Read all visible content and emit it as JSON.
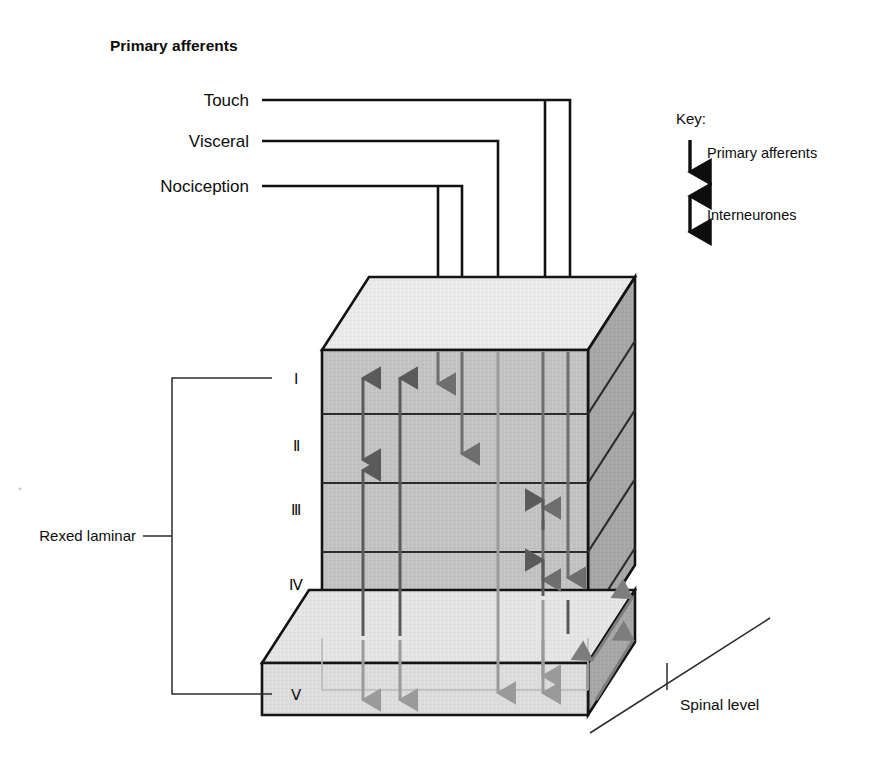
{
  "figure": {
    "title": "Primary afferents"
  },
  "afferents": [
    {
      "id": "touch",
      "label": "Touch"
    },
    {
      "id": "visceral",
      "label": "Visceral"
    },
    {
      "id": "nociception",
      "label": "Nociception"
    }
  ],
  "key": {
    "heading": "Key:",
    "items": [
      {
        "id": "primary-afferents",
        "label": "Primary afferents",
        "arrow": "down-arrow-icon"
      },
      {
        "id": "interneurones",
        "label": "Interneurones",
        "arrow": "double-headed-arrow-icon"
      }
    ]
  },
  "laminae": {
    "bracket_label": "Rexed laminar",
    "levels": [
      {
        "id": "lamina-1",
        "numeral": "Ⅰ"
      },
      {
        "id": "lamina-2",
        "numeral": "Ⅱ"
      },
      {
        "id": "lamina-3",
        "numeral": "Ⅲ"
      },
      {
        "id": "lamina-4",
        "numeral": "Ⅳ"
      },
      {
        "id": "lamina-5",
        "numeral": "Ⅴ"
      }
    ]
  },
  "depth_axis": {
    "label": "Spinal level"
  },
  "colors": {
    "top_face": "#e9e9e9",
    "front_face": "#c2c2c2",
    "right_face": "#a6a6a6",
    "slab_front": "#dcdcdc",
    "slab_top": "#e4e4e4",
    "outline": "#141414",
    "afferent_arrow": "#6e6e6e",
    "interneurone_arrow": "#5a5a5a",
    "text": "#0d0d0d"
  }
}
